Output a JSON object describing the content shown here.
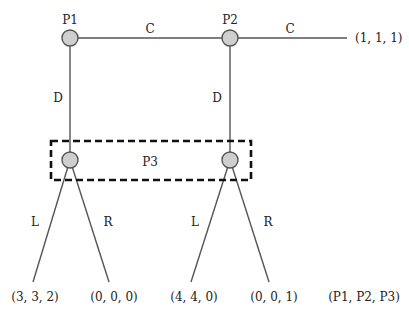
{
  "diagram": {
    "type": "extensive-form game tree",
    "nodes": {
      "p1": {
        "label": "P1",
        "x": 70,
        "y": 38
      },
      "p2": {
        "label": "P2",
        "x": 230,
        "y": 38
      },
      "p3_left": {
        "x": 70,
        "y": 160
      },
      "p3_right": {
        "x": 230,
        "y": 160
      }
    },
    "information_set": {
      "label": "P3"
    },
    "actions": {
      "p1_continue": "C",
      "p2_continue": "C",
      "p1_down": "D",
      "p2_down": "D",
      "p3_left_left": "L",
      "p3_left_right": "R",
      "p3_right_left": "L",
      "p3_right_right": "R"
    },
    "payoffs": {
      "p2_continue": "(1, 1, 1)",
      "leaf1": "(3, 3, 2)",
      "leaf2": "(0, 0, 0)",
      "leaf3": "(4, 4, 0)",
      "leaf4": "(0, 0, 1)"
    },
    "payoff_order_label": "(P1, P2, P3)",
    "colors": {
      "node_fill": "#cfcfcf",
      "edge": "#555555",
      "info_set_border": "#111111"
    }
  }
}
